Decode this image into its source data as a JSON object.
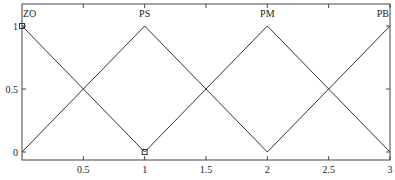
{
  "chart_data": {
    "type": "line",
    "title": "",
    "xlabel": "",
    "ylabel": "",
    "xlim": [
      0,
      3
    ],
    "ylim": [
      0,
      1
    ],
    "grid": false,
    "x_ticks": [
      0.5,
      1,
      1.5,
      2,
      2.5,
      3
    ],
    "x_tick_labels": [
      "0.5",
      "1",
      "1.5",
      "2",
      "2.5",
      "3"
    ],
    "y_ticks": [
      0,
      0.5,
      1
    ],
    "y_tick_labels": [
      "0",
      "0.5",
      "1"
    ],
    "series": [
      {
        "name": "ZO",
        "x": [
          0,
          1
        ],
        "y": [
          1,
          0
        ]
      },
      {
        "name": "PS",
        "x": [
          0,
          1,
          2
        ],
        "y": [
          0,
          1,
          0
        ]
      },
      {
        "name": "PM",
        "x": [
          1,
          2,
          3
        ],
        "y": [
          0,
          1,
          0
        ]
      },
      {
        "name": "PB",
        "x": [
          2,
          3
        ],
        "y": [
          0,
          1
        ]
      }
    ],
    "labels": [
      {
        "text": "ZO",
        "x": 0.0
      },
      {
        "text": "PS",
        "x": 1
      },
      {
        "text": "PM",
        "x": 2
      },
      {
        "text": "PB",
        "x": 3
      }
    ],
    "markers": [
      {
        "shape": "square",
        "x": 0,
        "y": 1
      },
      {
        "shape": "square",
        "x": 1,
        "y": 0
      }
    ],
    "line_color": "#333333"
  }
}
